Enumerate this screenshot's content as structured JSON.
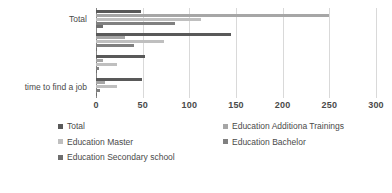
{
  "chart_data": {
    "type": "bar",
    "orientation": "horizontal",
    "title": "",
    "xlabel": "",
    "ylabel": "",
    "xlim": [
      0,
      300
    ],
    "xticks": [
      0,
      50,
      100,
      150,
      200,
      250,
      300
    ],
    "grid": true,
    "legend_position": "bottom",
    "categories": [
      "Total",
      "",
      "",
      "time to find a job"
    ],
    "axis_category_labels": {
      "top": "Total",
      "bottom": "time to find a job"
    },
    "series": [
      {
        "name": "Total",
        "color": "#595959",
        "values": [
          48,
          145,
          53,
          49
        ]
      },
      {
        "name": "Education Additiona Trainings",
        "color": "#a6a6a6",
        "values": [
          250,
          31,
          8,
          10
        ]
      },
      {
        "name": "Education Master",
        "color": "#bfbfbf",
        "values": [
          112,
          73,
          22,
          22
        ]
      },
      {
        "name": "Education Bachelor",
        "color": "#808080",
        "values": [
          85,
          41,
          3,
          4
        ]
      },
      {
        "name": "Education Secondary school",
        "color": "#6e6e6e",
        "values": [
          8,
          0,
          0,
          0
        ]
      }
    ],
    "legend_entries": [
      "Total",
      "Education Additiona Trainings",
      "Education Master",
      "Education Bachelor",
      "Education Secondary school"
    ]
  }
}
